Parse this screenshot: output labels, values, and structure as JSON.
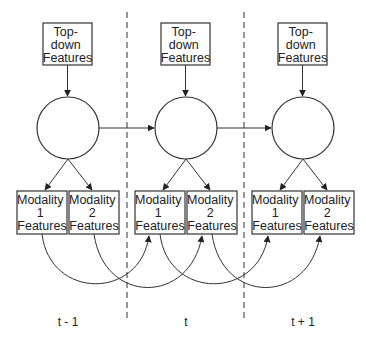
{
  "diagram": {
    "type": "dynamic-bayesian-network",
    "columns": [
      {
        "time_label": "t - 1",
        "top_down": [
          "Top-",
          "down",
          "Features"
        ],
        "modality1": [
          "Modality",
          "1",
          "Features"
        ],
        "modality2": [
          "Modality",
          "2",
          "Features"
        ]
      },
      {
        "time_label": "t",
        "top_down": [
          "Top-",
          "down",
          "Features"
        ],
        "modality1": [
          "Modality",
          "1",
          "Features"
        ],
        "modality2": [
          "Modality",
          "2",
          "Features"
        ]
      },
      {
        "time_label": "t + 1",
        "top_down": [
          "Top-",
          "down",
          "Features"
        ],
        "modality1": [
          "Modality",
          "1",
          "Features"
        ],
        "modality2": [
          "Modality",
          "2",
          "Features"
        ]
      }
    ],
    "edges": [
      "top-down -> hidden (each slice)",
      "hidden -> modality 1 (each slice)",
      "hidden -> modality 2 (each slice)",
      "hidden(t-1) -> hidden(t)",
      "hidden(t) -> hidden(t+1)",
      "modality 1(t-1) -> modality 1(t)",
      "modality 2(t-1) -> modality 2(t)",
      "modality 1(t) -> modality 1(t+1)",
      "modality 2(t) -> modality 2(t+1)"
    ],
    "colors": {
      "stroke": "#333333",
      "background": "#ffffff"
    }
  }
}
